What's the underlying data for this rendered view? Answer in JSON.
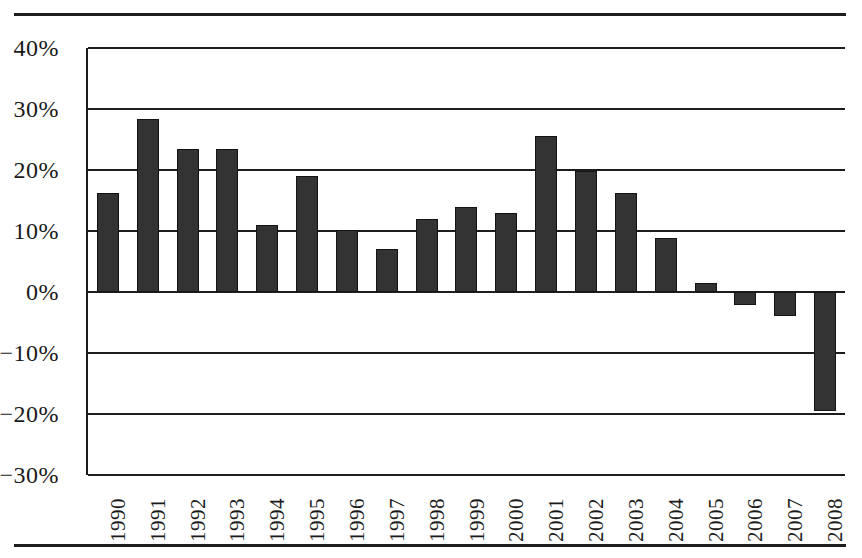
{
  "chart_data": {
    "type": "bar",
    "title": "",
    "subtitle": "",
    "xlabel": "",
    "ylabel": "",
    "categories": [
      "1990",
      "1991",
      "1992",
      "1993",
      "1994",
      "1995",
      "1996",
      "1997",
      "1998",
      "1999",
      "2000",
      "2001",
      "2002",
      "2003",
      "2004",
      "2005",
      "2006",
      "2007",
      "2008"
    ],
    "values": [
      16.3,
      28.3,
      23.5,
      23.5,
      11.0,
      19.0,
      10.2,
      7.0,
      12.0,
      13.9,
      13.0,
      25.6,
      19.8,
      16.3,
      8.9,
      1.5,
      -2.2,
      -4.0,
      -19.5
    ],
    "value_suffix": "%",
    "ylim": [
      -30,
      40
    ],
    "ytick_values": [
      40,
      30,
      20,
      10,
      0,
      -10,
      -20,
      -30
    ],
    "ytick_labels": [
      "40%",
      "30%",
      "20%",
      "10%",
      "0%",
      "−10%",
      "−20%",
      "−30%"
    ],
    "grid": true,
    "gridlines_horizontal": true,
    "legend": null,
    "legend_position": "none",
    "bar_color": "#333333",
    "bar_edge_color": "#141414",
    "axis_color": "#1d1d1d",
    "background_color": "#ffffff",
    "series": [
      {
        "name": "value",
        "values": [
          16.3,
          28.3,
          23.5,
          23.5,
          11.0,
          19.0,
          10.2,
          7.0,
          12.0,
          13.9,
          13.0,
          25.6,
          19.8,
          16.3,
          8.9,
          1.5,
          -2.2,
          -4.0,
          -19.5
        ]
      }
    ]
  },
  "figure": {
    "top_rule": "",
    "bottom_rule": ""
  }
}
